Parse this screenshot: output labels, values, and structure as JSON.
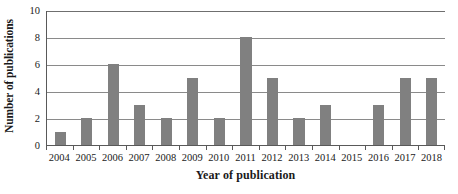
{
  "chart_data": {
    "type": "bar",
    "title": "",
    "xlabel": "Year of publication",
    "ylabel": "Number of publications",
    "categories": [
      "2004",
      "2005",
      "2006",
      "2007",
      "2008",
      "2009",
      "2010",
      "2011",
      "2012",
      "2013",
      "2014",
      "2015",
      "2016",
      "2017",
      "2018"
    ],
    "values": [
      1,
      2,
      6,
      3,
      2,
      5,
      2,
      8,
      5,
      2,
      3,
      0,
      3,
      5,
      5
    ],
    "series": [
      {
        "name": "Number of publications",
        "values": [
          1,
          2,
          6,
          3,
          2,
          5,
          2,
          8,
          5,
          2,
          3,
          0,
          3,
          5,
          5
        ]
      }
    ],
    "ylim": [
      0,
      10
    ],
    "ytick_values": [
      0,
      2,
      4,
      6,
      8,
      10
    ],
    "ytick_labels": [
      "0",
      "2",
      "4",
      "6",
      "8",
      "10"
    ],
    "grid": "horizontal",
    "legend": "none",
    "bar_color": "#808080",
    "axis_color": "#595959",
    "gridline_color": "#8a8a8a",
    "background_color": "#ffffff"
  },
  "axes": {
    "x_title": "Year of publication",
    "y_title": "Number of publications"
  }
}
